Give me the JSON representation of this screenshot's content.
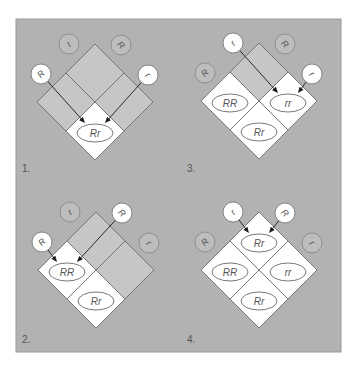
{
  "figure": {
    "panels": [
      {
        "id": "1",
        "label": "1.",
        "alleles": {
          "top_left": "r",
          "top_right": "R",
          "left": "R",
          "right": "r"
        },
        "active_alleles": [
          "left",
          "right"
        ],
        "cells": {
          "top": {
            "genotype": "",
            "filled": false
          },
          "left": {
            "genotype": "",
            "filled": false
          },
          "right": {
            "genotype": "",
            "filled": false
          },
          "bottom": {
            "genotype": "Rr",
            "filled": true
          }
        },
        "arrows_into": "bottom",
        "arrow_sources": [
          "left",
          "right"
        ]
      },
      {
        "id": "2",
        "label": "2.",
        "alleles": {
          "top_left": "r",
          "top_right": "R",
          "left": "R",
          "right": "r"
        },
        "active_alleles": [
          "left",
          "top_right"
        ],
        "cells": {
          "top": {
            "genotype": "",
            "filled": false
          },
          "left": {
            "genotype": "RR",
            "filled": true
          },
          "right": {
            "genotype": "",
            "filled": false
          },
          "bottom": {
            "genotype": "Rr",
            "filled": true
          }
        },
        "arrows_into": "left",
        "arrow_sources": [
          "left",
          "top_right"
        ]
      },
      {
        "id": "3",
        "label": "3.",
        "alleles": {
          "top_left": "r",
          "top_right": "R",
          "left": "R",
          "right": "r"
        },
        "active_alleles": [
          "top_left",
          "right"
        ],
        "cells": {
          "top": {
            "genotype": "",
            "filled": false
          },
          "left": {
            "genotype": "RR",
            "filled": true
          },
          "right": {
            "genotype": "rr",
            "filled": true
          },
          "bottom": {
            "genotype": "Rr",
            "filled": true
          }
        },
        "arrows_into": "right",
        "arrow_sources": [
          "top_left",
          "right"
        ]
      },
      {
        "id": "4",
        "label": "4.",
        "alleles": {
          "top_left": "r",
          "top_right": "R",
          "left": "R",
          "right": "r"
        },
        "active_alleles": [
          "top_left",
          "top_right"
        ],
        "cells": {
          "top": {
            "genotype": "Rr",
            "filled": true
          },
          "left": {
            "genotype": "RR",
            "filled": true
          },
          "right": {
            "genotype": "rr",
            "filled": true
          },
          "bottom": {
            "genotype": "Rr",
            "filled": true
          }
        },
        "arrows_into": "top",
        "arrow_sources": [
          "top_left",
          "top_right"
        ]
      }
    ]
  }
}
